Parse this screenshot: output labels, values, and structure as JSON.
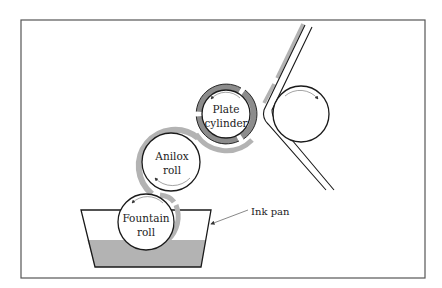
{
  "diagram": {
    "labels": {
      "plate_cylinder_line1": "Plate",
      "plate_cylinder_line2": "cylinder",
      "anilox_line1": "Anilox",
      "anilox_line2": "roll",
      "fountain_line1": "Fountain",
      "fountain_line2": "roll",
      "ink_pan": "Ink pan"
    },
    "components": [
      {
        "id": "fountain-roll",
        "name": "Fountain roll"
      },
      {
        "id": "anilox-roll",
        "name": "Anilox roll"
      },
      {
        "id": "plate-cylinder",
        "name": "Plate cylinder"
      },
      {
        "id": "impression-cylinder",
        "name": "Impression cylinder (unlabeled)"
      },
      {
        "id": "ink-pan",
        "name": "Ink pan"
      },
      {
        "id": "substrate-web",
        "name": "Substrate web (unlabeled)"
      }
    ],
    "colors": {
      "ink": "#b3b3b3",
      "plate": "#8c8c8c",
      "stroke": "#1a1a1a",
      "frame": "#555555"
    }
  }
}
